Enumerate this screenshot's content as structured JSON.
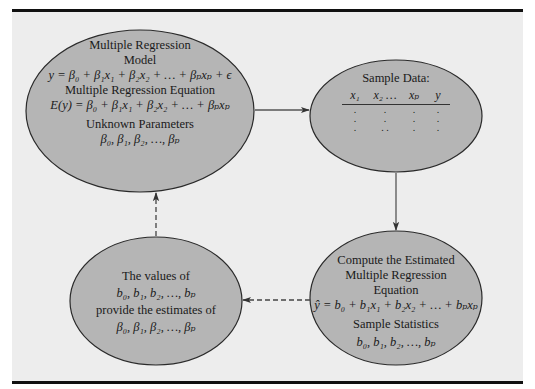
{
  "colors": {
    "background": "#ededed",
    "node_fill": "#b5b5b5",
    "node_stroke": "#2a2a2a",
    "arrow": "#555555",
    "rule": "#111111"
  },
  "nodes": {
    "model": {
      "title_line1": "Multiple Regression",
      "title_line2": "Model",
      "model_eq": "y = β₀ + β₁x₁ + β₂x₂ + … + βₚxₚ + ϵ",
      "equation_title": "Multiple Regression Equation",
      "equation": "E(y) = β₀ + β₁x₁ + β₂x₂ + … + βₚxₚ",
      "params_title": "Unknown Parameters",
      "params": "β₀, β₁, β₂, …, βₚ"
    },
    "sample": {
      "title": "Sample Data:",
      "columns": [
        "x₁",
        "x₂ …",
        "xₚ",
        "y"
      ],
      "rows": [
        [
          ".",
          ".",
          ".",
          "."
        ],
        [
          ".",
          ".",
          ".",
          "."
        ],
        [
          ".",
          ". .",
          ".",
          "."
        ]
      ]
    },
    "compute": {
      "title_line1": "Compute the Estimated",
      "title_line2": "Multiple Regression",
      "title_line3": "Equation",
      "equation": "ŷ = b₀ + b₁x₁ + b₂x₂ + … + bₚxₚ",
      "stats_title": "Sample Statistics",
      "stats": "b₀, b₁, b₂, …, bₚ"
    },
    "estimates": {
      "line1": "The values of",
      "line2": "b₀, b₁, b₂, …, bₚ",
      "line3": "provide the estimates of",
      "line4": "β₀, β₁, β₂, …, βₚ"
    }
  },
  "edges": [
    {
      "from": "model",
      "to": "sample",
      "style": "solid"
    },
    {
      "from": "sample",
      "to": "compute",
      "style": "solid"
    },
    {
      "from": "compute",
      "to": "estimates",
      "style": "dashed"
    },
    {
      "from": "estimates",
      "to": "model",
      "style": "dashed"
    }
  ]
}
